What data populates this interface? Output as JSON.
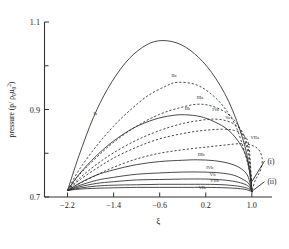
{
  "chart_data": {
    "type": "line",
    "title": "",
    "xlabel": "ξ",
    "ylabel": "pressure (p/ ρ₀u₀²)",
    "xlim": [
      -2.6,
      1.35
    ],
    "ylim": [
      0.7,
      1.1
    ],
    "xticks": [
      "-2.2",
      "-1.4",
      "-0.6",
      "0.2",
      "1.0"
    ],
    "xtick_values": [
      -2.2,
      -1.4,
      -0.6,
      0.2,
      1.0
    ],
    "yticks": [
      "0.7",
      "0.9",
      "1.1"
    ],
    "ytick_values": [
      0.7,
      0.9,
      1.1
    ],
    "yminor_values": [
      0.8,
      1.0
    ],
    "grid": false,
    "legend": "none",
    "left_origin": {
      "x": -2.2,
      "y": 0.715
    },
    "right_origin": {
      "x": 1.0,
      "y": 0.712
    },
    "series": [
      {
        "name": "Ia",
        "style": "solid",
        "label": "Ia",
        "label_x": -1.72,
        "label_y": 0.888,
        "peak_x": -0.62,
        "peak_y": 1.057,
        "points": [
          {
            "x": -2.2,
            "y": 0.715
          },
          {
            "x": -2.0,
            "y": 0.795
          },
          {
            "x": -1.75,
            "y": 0.882
          },
          {
            "x": -1.5,
            "y": 0.948
          },
          {
            "x": -1.2,
            "y": 1.006
          },
          {
            "x": -0.9,
            "y": 1.042
          },
          {
            "x": -0.62,
            "y": 1.057
          },
          {
            "x": -0.3,
            "y": 1.052
          },
          {
            "x": 0.0,
            "y": 1.028
          },
          {
            "x": 0.3,
            "y": 0.985
          },
          {
            "x": 0.6,
            "y": 0.918
          },
          {
            "x": 0.85,
            "y": 0.83
          },
          {
            "x": 0.97,
            "y": 0.755
          },
          {
            "x": 1.0,
            "y": 0.712
          }
        ]
      },
      {
        "name": "IIa",
        "style": "dashed",
        "label": "IIa",
        "label_x": -0.35,
        "label_y": 0.975,
        "peak_x": -0.3,
        "peak_y": 0.962,
        "points": [
          {
            "x": -2.2,
            "y": 0.715
          },
          {
            "x": -2.0,
            "y": 0.762
          },
          {
            "x": -1.7,
            "y": 0.816
          },
          {
            "x": -1.4,
            "y": 0.862
          },
          {
            "x": -1.1,
            "y": 0.9
          },
          {
            "x": -0.8,
            "y": 0.932
          },
          {
            "x": -0.5,
            "y": 0.953
          },
          {
            "x": -0.3,
            "y": 0.962
          },
          {
            "x": 0.0,
            "y": 0.958
          },
          {
            "x": 0.25,
            "y": 0.94
          },
          {
            "x": 0.5,
            "y": 0.908
          },
          {
            "x": 0.72,
            "y": 0.862
          },
          {
            "x": 0.88,
            "y": 0.8
          },
          {
            "x": 0.97,
            "y": 0.752
          },
          {
            "x": 1.0,
            "y": 0.712
          }
        ]
      },
      {
        "name": "IIIa",
        "style": "dashed",
        "label": "IIIa",
        "label_x": 0.1,
        "label_y": 0.925,
        "peak_x": 0.05,
        "peak_y": 0.912,
        "points": [
          {
            "x": -2.2,
            "y": 0.715
          },
          {
            "x": -2.0,
            "y": 0.75
          },
          {
            "x": -1.7,
            "y": 0.79
          },
          {
            "x": -1.4,
            "y": 0.825
          },
          {
            "x": -1.0,
            "y": 0.862
          },
          {
            "x": -0.6,
            "y": 0.889
          },
          {
            "x": -0.25,
            "y": 0.904
          },
          {
            "x": 0.05,
            "y": 0.912
          },
          {
            "x": 0.3,
            "y": 0.908
          },
          {
            "x": 0.55,
            "y": 0.893
          },
          {
            "x": 0.75,
            "y": 0.866
          },
          {
            "x": 0.9,
            "y": 0.82
          },
          {
            "x": 0.98,
            "y": 0.755
          },
          {
            "x": 1.0,
            "y": 0.712
          }
        ]
      },
      {
        "name": "IIb",
        "style": "solid",
        "label": "IIb",
        "label_x": -0.12,
        "label_y": 0.898,
        "peak_x": -0.17,
        "peak_y": 0.888,
        "points": [
          {
            "x": -2.2,
            "y": 0.715
          },
          {
            "x": -2.0,
            "y": 0.752
          },
          {
            "x": -1.7,
            "y": 0.794
          },
          {
            "x": -1.4,
            "y": 0.828
          },
          {
            "x": -1.05,
            "y": 0.858
          },
          {
            "x": -0.7,
            "y": 0.877
          },
          {
            "x": -0.4,
            "y": 0.886
          },
          {
            "x": -0.17,
            "y": 0.888
          },
          {
            "x": 0.1,
            "y": 0.884
          },
          {
            "x": 0.35,
            "y": 0.872
          },
          {
            "x": 0.6,
            "y": 0.852
          },
          {
            "x": 0.8,
            "y": 0.82
          },
          {
            "x": 0.93,
            "y": 0.78
          },
          {
            "x": 1.0,
            "y": 0.712
          }
        ]
      },
      {
        "name": "IVa",
        "style": "dashed",
        "label": "IVa",
        "label_x": 0.37,
        "label_y": 0.896,
        "peak_x": 0.3,
        "peak_y": 0.878,
        "points": [
          {
            "x": -2.2,
            "y": 0.715
          },
          {
            "x": -2.0,
            "y": 0.742
          },
          {
            "x": -1.7,
            "y": 0.774
          },
          {
            "x": -1.4,
            "y": 0.801
          },
          {
            "x": -1.0,
            "y": 0.83
          },
          {
            "x": -0.6,
            "y": 0.852
          },
          {
            "x": -0.2,
            "y": 0.868
          },
          {
            "x": 0.15,
            "y": 0.876
          },
          {
            "x": 0.3,
            "y": 0.878
          },
          {
            "x": 0.5,
            "y": 0.876
          },
          {
            "x": 0.7,
            "y": 0.866
          },
          {
            "x": 0.85,
            "y": 0.845
          },
          {
            "x": 0.95,
            "y": 0.8
          },
          {
            "x": 1.0,
            "y": 0.712
          }
        ]
      },
      {
        "name": "Va",
        "style": "dashed",
        "label": "Va",
        "label_x": 0.58,
        "label_y": 0.878,
        "peak_x": 0.5,
        "peak_y": 0.855,
        "points": [
          {
            "x": -2.2,
            "y": 0.715
          },
          {
            "x": -2.0,
            "y": 0.738
          },
          {
            "x": -1.7,
            "y": 0.765
          },
          {
            "x": -1.4,
            "y": 0.789
          },
          {
            "x": -1.0,
            "y": 0.814
          },
          {
            "x": -0.6,
            "y": 0.833
          },
          {
            "x": -0.2,
            "y": 0.845
          },
          {
            "x": 0.15,
            "y": 0.852
          },
          {
            "x": 0.5,
            "y": 0.855
          },
          {
            "x": 0.7,
            "y": 0.852
          },
          {
            "x": 0.85,
            "y": 0.842
          },
          {
            "x": 0.95,
            "y": 0.815
          },
          {
            "x": 1.0,
            "y": 0.712
          }
        ]
      },
      {
        "name": "VIIa",
        "style": "dashed",
        "label": "VIIa",
        "label_x": 1.05,
        "label_y": 0.832,
        "peak_x": 0.82,
        "peak_y": 0.822,
        "points": [
          {
            "x": -2.2,
            "y": 0.715
          },
          {
            "x": -2.0,
            "y": 0.73
          },
          {
            "x": -1.7,
            "y": 0.75
          },
          {
            "x": -1.4,
            "y": 0.768
          },
          {
            "x": -1.0,
            "y": 0.787
          },
          {
            "x": -0.6,
            "y": 0.8
          },
          {
            "x": -0.2,
            "y": 0.808
          },
          {
            "x": 0.2,
            "y": 0.814
          },
          {
            "x": 0.55,
            "y": 0.819
          },
          {
            "x": 0.82,
            "y": 0.822
          },
          {
            "x": 1.0,
            "y": 0.818
          },
          {
            "x": 1.12,
            "y": 0.808
          },
          {
            "x": 1.18,
            "y": 0.788
          },
          {
            "x": 1.16,
            "y": 0.765
          },
          {
            "x": 1.1,
            "y": 0.748
          },
          {
            "x": 1.05,
            "y": 0.735
          },
          {
            "x": 1.0,
            "y": 0.712
          }
        ]
      },
      {
        "name": "IIIb",
        "style": "solid",
        "label": "IIIb",
        "label_x": 0.12,
        "label_y": 0.793,
        "peak_x": 0.05,
        "peak_y": 0.785,
        "points": [
          {
            "x": -2.2,
            "y": 0.715
          },
          {
            "x": -2.0,
            "y": 0.731
          },
          {
            "x": -1.7,
            "y": 0.75
          },
          {
            "x": -1.4,
            "y": 0.762
          },
          {
            "x": -1.0,
            "y": 0.774
          },
          {
            "x": -0.6,
            "y": 0.781
          },
          {
            "x": -0.2,
            "y": 0.784
          },
          {
            "x": 0.05,
            "y": 0.785
          },
          {
            "x": 0.35,
            "y": 0.783
          },
          {
            "x": 0.6,
            "y": 0.777
          },
          {
            "x": 0.8,
            "y": 0.766
          },
          {
            "x": 0.93,
            "y": 0.748
          },
          {
            "x": 1.0,
            "y": 0.712
          }
        ]
      },
      {
        "name": "IVb",
        "style": "solid",
        "label": "IVb",
        "label_x": 0.27,
        "label_y": 0.764,
        "peak_x": 0.15,
        "peak_y": 0.757,
        "points": [
          {
            "x": -2.2,
            "y": 0.715
          },
          {
            "x": -2.0,
            "y": 0.726
          },
          {
            "x": -1.7,
            "y": 0.738
          },
          {
            "x": -1.4,
            "y": 0.745
          },
          {
            "x": -1.0,
            "y": 0.752
          },
          {
            "x": -0.6,
            "y": 0.755
          },
          {
            "x": -0.2,
            "y": 0.757
          },
          {
            "x": 0.15,
            "y": 0.757
          },
          {
            "x": 0.45,
            "y": 0.755
          },
          {
            "x": 0.68,
            "y": 0.75
          },
          {
            "x": 0.85,
            "y": 0.74
          },
          {
            "x": 0.95,
            "y": 0.73
          },
          {
            "x": 1.0,
            "y": 0.712
          }
        ]
      },
      {
        "name": "Vb",
        "style": "solid",
        "label": "Vb",
        "label_x": 0.32,
        "label_y": 0.748,
        "peak_x": 0.2,
        "peak_y": 0.741,
        "points": [
          {
            "x": -2.2,
            "y": 0.715
          },
          {
            "x": -2.0,
            "y": 0.723
          },
          {
            "x": -1.7,
            "y": 0.731
          },
          {
            "x": -1.4,
            "y": 0.735
          },
          {
            "x": -1.0,
            "y": 0.739
          },
          {
            "x": -0.6,
            "y": 0.74
          },
          {
            "x": -0.2,
            "y": 0.741
          },
          {
            "x": 0.2,
            "y": 0.741
          },
          {
            "x": 0.5,
            "y": 0.739
          },
          {
            "x": 0.72,
            "y": 0.735
          },
          {
            "x": 0.88,
            "y": 0.729
          },
          {
            "x": 0.96,
            "y": 0.722
          },
          {
            "x": 1.0,
            "y": 0.712
          }
        ]
      },
      {
        "name": "VIIb",
        "style": "solid",
        "label": "VIIb",
        "label_x": 0.35,
        "label_y": 0.735,
        "peak_x": 0.2,
        "peak_y": 0.729,
        "points": [
          {
            "x": -2.2,
            "y": 0.715
          },
          {
            "x": -2.0,
            "y": 0.72
          },
          {
            "x": -1.7,
            "y": 0.725
          },
          {
            "x": -1.4,
            "y": 0.727
          },
          {
            "x": -1.0,
            "y": 0.728
          },
          {
            "x": -0.6,
            "y": 0.729
          },
          {
            "x": -0.2,
            "y": 0.729
          },
          {
            "x": 0.2,
            "y": 0.729
          },
          {
            "x": 0.5,
            "y": 0.728
          },
          {
            "x": 0.75,
            "y": 0.725
          },
          {
            "x": 0.9,
            "y": 0.721
          },
          {
            "x": 0.97,
            "y": 0.717
          },
          {
            "x": 1.0,
            "y": 0.712
          }
        ]
      },
      {
        "name": "VIb",
        "style": "solid",
        "label": "VIb",
        "label_x": 0.14,
        "label_y": 0.718,
        "peak_x": 0.0,
        "peak_y": 0.722,
        "points": [
          {
            "x": -2.2,
            "y": 0.715
          },
          {
            "x": -2.0,
            "y": 0.718
          },
          {
            "x": -1.7,
            "y": 0.72
          },
          {
            "x": -1.4,
            "y": 0.721
          },
          {
            "x": -1.0,
            "y": 0.722
          },
          {
            "x": -0.6,
            "y": 0.722
          },
          {
            "x": -0.2,
            "y": 0.722
          },
          {
            "x": 0.2,
            "y": 0.722
          },
          {
            "x": 0.55,
            "y": 0.721
          },
          {
            "x": 0.8,
            "y": 0.719
          },
          {
            "x": 0.93,
            "y": 0.716
          },
          {
            "x": 1.0,
            "y": 0.712
          }
        ]
      }
    ],
    "annotations": [
      {
        "name": "note-i",
        "text": "(i)",
        "text_x": 1.27,
        "text_y": 0.782,
        "leader_from": {
          "x": 1.0,
          "y": 0.735
        },
        "leader_to": {
          "x": 1.22,
          "y": 0.782
        }
      },
      {
        "name": "note-ii",
        "text": "(ii)",
        "text_x": 1.27,
        "text_y": 0.735,
        "leader_from": {
          "x": 1.01,
          "y": 0.714
        },
        "leader_to": {
          "x": 1.22,
          "y": 0.735
        }
      }
    ]
  }
}
